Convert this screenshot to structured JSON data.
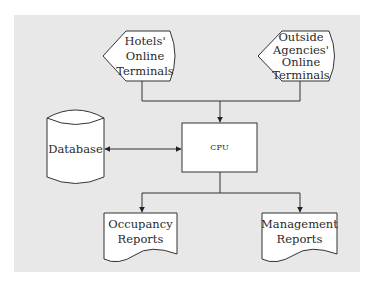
{
  "diagram": {
    "type": "system-flowchart",
    "nodes": {
      "hotels_terminals": {
        "shape": "display",
        "label_lines": [
          "Hotels'",
          "Online",
          "Terminals"
        ],
        "label": "Hotels' Online Terminals"
      },
      "outside_terminals": {
        "shape": "display",
        "label_lines": [
          "Outside",
          "Agencies'",
          "Online",
          "Terminals"
        ],
        "label": "Outside Agencies' Online Terminals"
      },
      "cpu": {
        "shape": "process",
        "label": "CPU"
      },
      "database": {
        "shape": "cylinder",
        "label": "Database"
      },
      "occupancy_reports": {
        "shape": "document",
        "label_lines": [
          "Occupancy",
          "Reports"
        ],
        "label": "Occupancy Reports"
      },
      "management_reports": {
        "shape": "document",
        "label_lines": [
          "Management",
          "Reports"
        ],
        "label": "Management Reports"
      }
    },
    "edges": [
      {
        "from": "Hotels' Online Terminals",
        "to": "CPU",
        "arrow": "forward"
      },
      {
        "from": "Outside Agencies' Online Terminals",
        "to": "CPU",
        "arrow": "forward"
      },
      {
        "from": "Database",
        "to": "CPU",
        "arrow": "bidirectional"
      },
      {
        "from": "CPU",
        "to": "Occupancy Reports",
        "arrow": "forward"
      },
      {
        "from": "CPU",
        "to": "Management Reports",
        "arrow": "forward"
      }
    ],
    "colors": {
      "background": "#e8e8e8",
      "shape_fill": "#ffffff",
      "stroke": "#333333"
    }
  }
}
